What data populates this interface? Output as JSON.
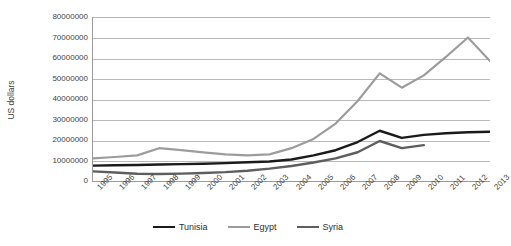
{
  "chart_data": {
    "type": "line",
    "title": "",
    "xlabel": "",
    "ylabel": "US dollars",
    "ylim": [
      0,
      80000000
    ],
    "grid": true,
    "legend_position": "bottom",
    "x": [
      "1995",
      "1996",
      "1997",
      "1998",
      "1999",
      "2000",
      "2001",
      "2002",
      "2003",
      "2004",
      "2005",
      "2006",
      "2007",
      "2008",
      "2009",
      "2010",
      "2011",
      "2012",
      "2013"
    ],
    "ytick_labels": [
      "80000000",
      "70000000",
      "60000000",
      "50000000",
      "40000000",
      "30000000",
      "20000000",
      "10000000",
      "0"
    ],
    "ytick_values": [
      80000000,
      70000000,
      60000000,
      50000000,
      40000000,
      30000000,
      20000000,
      10000000,
      0
    ],
    "series": [
      {
        "name": "Tunisia",
        "color": "#1a1a1a",
        "width": 2.4,
        "values": [
          8000000,
          8200000,
          8300000,
          8500000,
          8700000,
          8900000,
          9200000,
          9600000,
          10000000,
          11000000,
          13000000,
          15500000,
          19500000,
          25000000,
          21500000,
          23000000,
          23800000,
          24300000,
          24500000
        ]
      },
      {
        "name": "Egypt",
        "color": "#9c9c9c",
        "width": 2.2,
        "values": [
          11500000,
          12200000,
          13000000,
          16500000,
          15500000,
          14500000,
          13500000,
          13000000,
          13500000,
          16500000,
          21000000,
          28500000,
          39500000,
          53000000,
          46000000,
          52000000,
          61000000,
          70500000,
          59000000
        ]
      },
      {
        "name": "Syria",
        "color": "#5e5e5e",
        "width": 2.4,
        "values": [
          5200000,
          4600000,
          4000000,
          3900000,
          4100000,
          4400000,
          4800000,
          5500000,
          6500000,
          7800000,
          9500000,
          11500000,
          14500000,
          20000000,
          16500000,
          18000000,
          null,
          null,
          null
        ]
      }
    ]
  },
  "legend": {
    "items": [
      {
        "label": "Tunisia",
        "color": "#1a1a1a"
      },
      {
        "label": "Egypt",
        "color": "#9c9c9c"
      },
      {
        "label": "Syria",
        "color": "#5e5e5e"
      }
    ]
  }
}
